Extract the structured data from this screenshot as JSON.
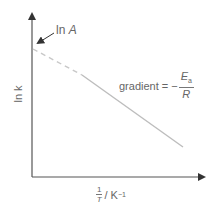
{
  "diagram": {
    "type": "arrhenius-plot",
    "y_axis_label": "ln k",
    "x_axis_label_numerator": "1",
    "x_axis_label_denominator": "T",
    "x_axis_label_unit": "/ K",
    "x_axis_label_unit_exp": "−1",
    "intercept_label_prefix": "ln ",
    "intercept_label_var": "A",
    "gradient_label": "gradient = −",
    "gradient_numerator_var": "E",
    "gradient_numerator_sub": "a",
    "gradient_denominator": "R",
    "colors": {
      "axis": "#555555",
      "line": "#bdbdbd",
      "text": "#666666"
    }
  }
}
